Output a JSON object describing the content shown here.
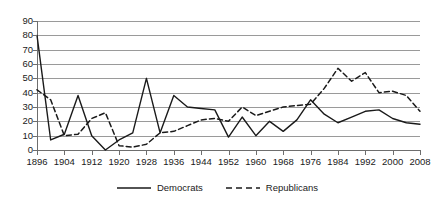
{
  "chart_data": {
    "type": "line",
    "title": "",
    "xlabel": "",
    "ylabel": "",
    "ylim": [
      0,
      90
    ],
    "ytick_step": 10,
    "grid": true,
    "legend_position": "bottom",
    "xtick_labels": [
      "1896",
      "1904",
      "1912",
      "1920",
      "1928",
      "1936",
      "1944",
      "1952",
      "1960",
      "1968",
      "1976",
      "1984",
      "1992",
      "2000",
      "2008"
    ],
    "ytick_labels": [
      "0",
      "10",
      "20",
      "30",
      "40",
      "50",
      "60",
      "70",
      "80",
      "90"
    ],
    "x": [
      1896,
      1900,
      1904,
      1908,
      1912,
      1916,
      1920,
      1924,
      1928,
      1932,
      1936,
      1940,
      1944,
      1948,
      1952,
      1956,
      1960,
      1964,
      1968,
      1972,
      1976,
      1980,
      1984,
      1988,
      1992,
      1996,
      2000,
      2004,
      2008
    ],
    "series": [
      {
        "name": "Democrats",
        "style": "solid",
        "color": "#1a1a1a",
        "values": [
          80,
          7,
          11,
          38,
          10,
          0,
          7,
          12,
          50,
          12,
          38,
          30,
          29,
          28,
          9,
          23,
          10,
          20,
          13,
          21,
          35,
          25,
          19,
          23,
          27,
          28,
          22,
          19,
          18
        ]
      },
      {
        "name": "Republicans",
        "style": "dashed",
        "color": "#1a1a1a",
        "values": [
          42,
          35,
          10,
          11,
          22,
          26,
          3,
          2,
          4,
          12,
          13,
          17,
          21,
          22,
          20,
          30,
          24,
          27,
          30,
          31,
          32,
          43,
          57,
          48,
          54,
          40,
          41,
          38,
          27
        ]
      }
    ]
  },
  "legend": {
    "items": [
      {
        "label": "Democrats",
        "style": "solid"
      },
      {
        "label": "Republicans",
        "style": "dashed"
      }
    ]
  }
}
